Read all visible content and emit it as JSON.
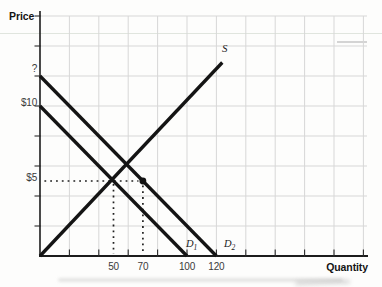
{
  "figure": {
    "background": "#fdfdfc",
    "colors": {
      "curve": "#141414",
      "axis": "#1c1c1c",
      "tick": "#2a2a2a",
      "grid": "#d7d7d7",
      "guide": "#1f1f1f",
      "marker": "#111111",
      "text": "#3a3a3a"
    }
  },
  "labels": {
    "price": "Price",
    "quantity": "Quantity"
  },
  "chart_data": {
    "type": "line",
    "title": "",
    "xlabel": "Quantity",
    "ylabel": "Price",
    "xlim": [
      0,
      223
    ],
    "ylim": [
      0,
      16.3
    ],
    "grid": true,
    "x_axis": {
      "tick_step": 20,
      "ticks": [
        20,
        40,
        60,
        80,
        100,
        120,
        140,
        160,
        180,
        200,
        220
      ],
      "labeled_ticks": [
        50,
        70,
        100,
        120
      ]
    },
    "y_axis": {
      "tick_step": 2,
      "ticks": [
        2,
        4,
        6,
        8,
        10,
        12,
        14,
        16
      ],
      "labeled_ticks": [
        {
          "value": 12,
          "text": "?",
          "dy": -7
        },
        {
          "value": 10,
          "text": "$10",
          "dy": -3
        },
        {
          "value": 5,
          "text": "$5",
          "dy": -3
        }
      ]
    },
    "series": [
      {
        "name": "supply",
        "label": "S",
        "sub": "",
        "points": [
          [
            0,
            0
          ],
          [
            124,
            12.9
          ]
        ]
      },
      {
        "name": "demand-1",
        "label": "D",
        "sub": "1",
        "points": [
          [
            0,
            10
          ],
          [
            100,
            0
          ]
        ]
      },
      {
        "name": "demand-2",
        "label": "D",
        "sub": "2",
        "points": [
          [
            0,
            12
          ],
          [
            120,
            0
          ]
        ]
      }
    ],
    "marker_point": {
      "quantity": 70,
      "price": 5
    },
    "guide_lines": [
      {
        "orientation": "horizontal",
        "price": 5,
        "from_quantity": 3,
        "to_quantity": 67
      },
      {
        "orientation": "vertical",
        "quantity": 50,
        "from_price": 4.8,
        "to_price": 0.15
      },
      {
        "orientation": "vertical",
        "quantity": 70,
        "from_price": 4.7,
        "to_price": 0.15
      }
    ]
  }
}
